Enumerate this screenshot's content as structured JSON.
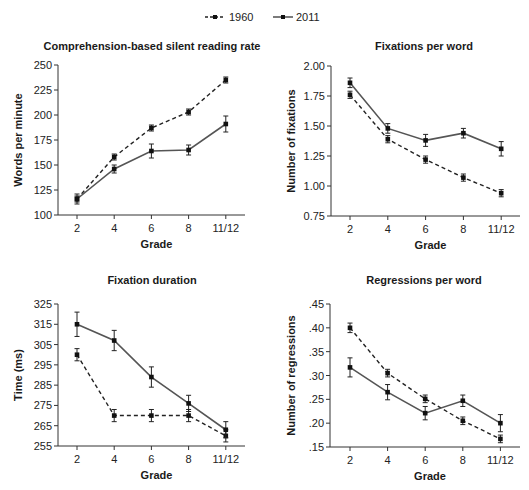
{
  "legend": [
    {
      "name": "1960",
      "style": "dashed"
    },
    {
      "name": "2011",
      "style": "solid"
    }
  ],
  "chart_data": [
    {
      "type": "line",
      "title": "Comprehension-based silent reading rate",
      "xlabel": "Grade",
      "ylabel": "Words per minute",
      "categories": [
        "2",
        "4",
        "6",
        "8",
        "11/12"
      ],
      "ylim": [
        100,
        250
      ],
      "yticks": [
        "100",
        "125",
        "150",
        "175",
        "200",
        "225",
        "250"
      ],
      "ytick_values": [
        100,
        125,
        150,
        175,
        200,
        225,
        250
      ],
      "series": [
        {
          "name": "1960",
          "values": [
            116,
            158,
            187,
            203,
            235
          ],
          "errors": [
            3,
            3,
            3,
            3,
            3
          ]
        },
        {
          "name": "2011",
          "values": [
            116,
            146,
            164,
            165,
            191
          ],
          "errors": [
            5,
            4,
            7,
            5,
            8
          ]
        }
      ]
    },
    {
      "type": "line",
      "title": "Fixations per word",
      "xlabel": "Grade",
      "ylabel": "Number of fixations",
      "categories": [
        "2",
        "4",
        "6",
        "8",
        "11/12"
      ],
      "ylim": [
        0.75,
        2.0
      ],
      "yticks": [
        "0.75",
        "1.00",
        "1.25",
        "1.50",
        "1.75",
        "2.00"
      ],
      "ytick_values": [
        0.75,
        1.0,
        1.25,
        1.5,
        1.75,
        2.0
      ],
      "series": [
        {
          "name": "1960",
          "values": [
            1.76,
            1.39,
            1.22,
            1.07,
            0.94
          ],
          "errors": [
            0.03,
            0.03,
            0.03,
            0.03,
            0.03
          ]
        },
        {
          "name": "2011",
          "values": [
            1.86,
            1.48,
            1.38,
            1.44,
            1.31
          ],
          "errors": [
            0.04,
            0.04,
            0.05,
            0.04,
            0.06
          ]
        }
      ]
    },
    {
      "type": "line",
      "title": "Fixation duration",
      "xlabel": "Grade",
      "ylabel": "Time (ms)",
      "categories": [
        "2",
        "4",
        "6",
        "8",
        "11/12"
      ],
      "ylim": [
        255,
        325
      ],
      "yticks": [
        "255",
        "265",
        "275",
        "285",
        "295",
        "305",
        "315",
        "325"
      ],
      "ytick_values": [
        255,
        265,
        275,
        285,
        295,
        305,
        315,
        325
      ],
      "series": [
        {
          "name": "1960",
          "values": [
            300,
            270,
            270,
            270,
            260
          ],
          "errors": [
            3,
            3,
            3,
            3,
            3
          ]
        },
        {
          "name": "2011",
          "values": [
            315,
            307,
            289,
            276,
            263
          ],
          "errors": [
            6,
            5,
            5,
            4,
            4
          ]
        }
      ]
    },
    {
      "type": "line",
      "title": "Regressions per word",
      "xlabel": "Grade",
      "ylabel": "Number of regressions",
      "categories": [
        "2",
        "4",
        "6",
        "8",
        "11/12"
      ],
      "ylim": [
        0.15,
        0.45
      ],
      "yticks": [
        ".15",
        ".20",
        ".25",
        ".30",
        ".35",
        ".40",
        ".45"
      ],
      "ytick_values": [
        0.15,
        0.2,
        0.25,
        0.3,
        0.35,
        0.4,
        0.45
      ],
      "series": [
        {
          "name": "1960",
          "values": [
            0.4,
            0.305,
            0.251,
            0.205,
            0.167
          ],
          "errors": [
            0.01,
            0.008,
            0.008,
            0.008,
            0.008
          ]
        },
        {
          "name": "2011",
          "values": [
            0.317,
            0.265,
            0.221,
            0.247,
            0.2
          ],
          "errors": [
            0.02,
            0.016,
            0.014,
            0.012,
            0.018
          ]
        }
      ]
    }
  ]
}
